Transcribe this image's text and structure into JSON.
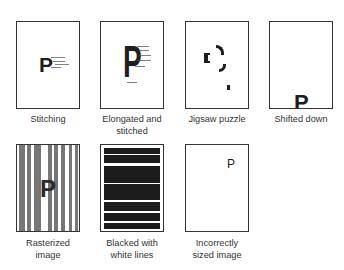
{
  "figure": {
    "panels": [
      {
        "id": "stitching",
        "label_lines": [
          "Stitching"
        ],
        "glyph": "P"
      },
      {
        "id": "elongated",
        "label_lines": [
          "Elongated and",
          "stitched"
        ],
        "glyph": "P"
      },
      {
        "id": "jigsaw",
        "label_lines": [
          "Jigsaw puzzle"
        ],
        "glyph": ""
      },
      {
        "id": "shifted",
        "label_lines": [
          "Shifted down"
        ],
        "glyph": "P"
      },
      {
        "id": "rasterized",
        "label_lines": [
          "Rasterized",
          "image"
        ],
        "glyph": "P"
      },
      {
        "id": "blacked",
        "label_lines": [
          "Blacked with",
          "white lines"
        ],
        "glyph": ""
      },
      {
        "id": "incorrect-size",
        "label_lines": [
          "Incorrectly",
          "sized image"
        ],
        "glyph": "P"
      }
    ]
  },
  "colors": {
    "ink": "#1e1e1e",
    "border": "#333333",
    "background": "#ffffff"
  }
}
